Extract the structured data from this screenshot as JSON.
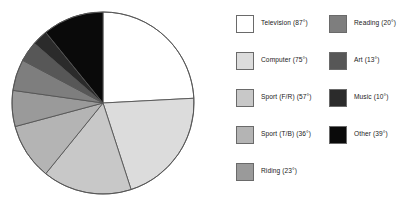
{
  "chart_data": {
    "type": "pie",
    "title": "",
    "subtitle": "",
    "xlabel": "",
    "ylabel": "",
    "units": "degrees",
    "total_degrees": 360,
    "start_angle_deg": 0,
    "direction": "clockwise",
    "legend_position": "right",
    "grid": false,
    "categories": [
      "Television",
      "Computer",
      "Sport (F/R)",
      "Sport (T/B)",
      "Riding",
      "Reading",
      "Art",
      "Music",
      "Other"
    ],
    "values": [
      87,
      75,
      57,
      36,
      23,
      20,
      13,
      10,
      39
    ],
    "colors": [
      "#ffffff",
      "#dcdcdc",
      "#c8c8c8",
      "#b4b4b4",
      "#9a9a9a",
      "#7e7e7e",
      "#575757",
      "#2b2b2b",
      "#0a0a0a"
    ],
    "slices": [
      {
        "label": "Television",
        "value": 87,
        "color": "#ffffff"
      },
      {
        "label": "Computer",
        "value": 75,
        "color": "#dcdcdc"
      },
      {
        "label": "Sport (F/R)",
        "value": 57,
        "color": "#c8c8c8"
      },
      {
        "label": "Sport (T/B)",
        "value": 36,
        "color": "#b4b4b4"
      },
      {
        "label": "Riding",
        "value": 23,
        "color": "#9a9a9a"
      },
      {
        "label": "Reading",
        "value": 20,
        "color": "#7e7e7e"
      },
      {
        "label": "Art",
        "value": 13,
        "color": "#575757"
      },
      {
        "label": "Music",
        "value": 10,
        "color": "#2b2b2b"
      },
      {
        "label": "Other",
        "value": 39,
        "color": "#0a0a0a"
      }
    ]
  },
  "legend": {
    "columns": [
      {
        "items": [
          {
            "label": "Television (87°)",
            "swatch": "#ffffff"
          },
          {
            "label": "Computer (75°)",
            "swatch": "#dcdcdc"
          },
          {
            "label": "Sport (F/R) (57°)",
            "swatch": "#c8c8c8"
          },
          {
            "label": "Sport (T/B) (36°)",
            "swatch": "#b4b4b4"
          },
          {
            "label": "Riding (23°)",
            "swatch": "#9a9a9a"
          }
        ]
      },
      {
        "items": [
          {
            "label": "Reading (20°)",
            "swatch": "#7e7e7e"
          },
          {
            "label": "Art (13°)",
            "swatch": "#575757"
          },
          {
            "label": "Music (10°)",
            "swatch": "#2b2b2b"
          },
          {
            "label": "Other (39°)",
            "swatch": "#0a0a0a"
          }
        ]
      }
    ]
  },
  "pie_geometry": {
    "center_x": 103,
    "center_y": 103,
    "radius": 91,
    "stroke": "#555555",
    "stroke_width": 0.9
  }
}
